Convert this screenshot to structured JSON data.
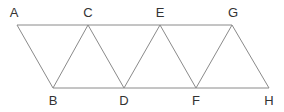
{
  "diagram": {
    "colors": {
      "line": "#8a8a8a",
      "label": "#333333",
      "background": "#ffffff"
    },
    "vertices": [
      {
        "id": "A",
        "label": "A",
        "x": 17,
        "y": 25
      },
      {
        "id": "B",
        "label": "B",
        "x": 53,
        "y": 88
      },
      {
        "id": "C",
        "label": "C",
        "x": 88,
        "y": 25
      },
      {
        "id": "D",
        "label": "D",
        "x": 124,
        "y": 88
      },
      {
        "id": "E",
        "label": "E",
        "x": 160,
        "y": 25
      },
      {
        "id": "F",
        "label": "F",
        "x": 196,
        "y": 88
      },
      {
        "id": "G",
        "label": "G",
        "x": 232,
        "y": 25
      },
      {
        "id": "H",
        "label": "H",
        "x": 269,
        "y": 88
      }
    ],
    "edges": [
      [
        "A",
        "G"
      ],
      [
        "B",
        "H"
      ],
      [
        "A",
        "B"
      ],
      [
        "B",
        "C"
      ],
      [
        "C",
        "D"
      ],
      [
        "D",
        "E"
      ],
      [
        "E",
        "F"
      ],
      [
        "F",
        "G"
      ],
      [
        "G",
        "H"
      ]
    ],
    "labels": {
      "A": "A",
      "B": "B",
      "C": "C",
      "D": "D",
      "E": "E",
      "F": "F",
      "G": "G",
      "H": "H"
    }
  }
}
